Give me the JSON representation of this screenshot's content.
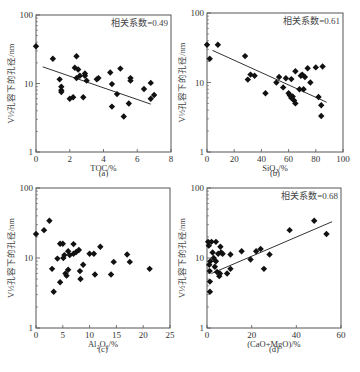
{
  "figure": {
    "ylabel": "V½孔容下的孔径/nm",
    "panels": [
      {
        "id": "a",
        "label": "(a)",
        "xlabel": "TOC/%",
        "corr": "相关系数=0.49"
      },
      {
        "id": "b",
        "label": "(b)",
        "xlabel": "SiO₂/%",
        "corr": "相关系数=0.61"
      },
      {
        "id": "c",
        "label": "(c)",
        "xlabel": "Al₂O₃/%",
        "corr": ""
      },
      {
        "id": "d",
        "label": "(d)",
        "xlabel": "(CaO+MgO)/%",
        "corr": "相关系数=0.68"
      }
    ]
  },
  "chart_data": [
    {
      "type": "scatter",
      "title": "(a)",
      "xlabel": "TOC/%",
      "ylabel": "V½孔容下的孔径/nm",
      "xlim": [
        0,
        8
      ],
      "ylim": [
        1,
        100
      ],
      "yscale": "log",
      "xticks": [
        0,
        2,
        4,
        6,
        8
      ],
      "yticks": [
        1,
        10,
        100
      ],
      "annotation": "相关系数=0.49",
      "points": [
        [
          0,
          35
        ],
        [
          1,
          23
        ],
        [
          1.4,
          11.5
        ],
        [
          1.5,
          9
        ],
        [
          1.5,
          8
        ],
        [
          1.5,
          7.5
        ],
        [
          2,
          6
        ],
        [
          2.2,
          6.3
        ],
        [
          2.3,
          17
        ],
        [
          2.4,
          25
        ],
        [
          2.4,
          12
        ],
        [
          2.5,
          16
        ],
        [
          2.6,
          13
        ],
        [
          2.8,
          6.3
        ],
        [
          2.9,
          14
        ],
        [
          2.9,
          13
        ],
        [
          3,
          11
        ],
        [
          3.6,
          11.5
        ],
        [
          3.7,
          12
        ],
        [
          4.4,
          14.5
        ],
        [
          4.5,
          9.8
        ],
        [
          4.5,
          4.6
        ],
        [
          4.8,
          7
        ],
        [
          5,
          16.5
        ],
        [
          5.2,
          3.3
        ],
        [
          5.5,
          5.1
        ],
        [
          5.6,
          11
        ],
        [
          5.6,
          12
        ],
        [
          6.4,
          8.3
        ],
        [
          6.8,
          10.2
        ],
        [
          6.8,
          6
        ],
        [
          7,
          6.8
        ]
      ],
      "trendline": {
        "x": [
          0.4,
          6.8
        ],
        "y": [
          17.5,
          5
        ]
      }
    },
    {
      "type": "scatter",
      "title": "(b)",
      "xlabel": "SiO₂/%",
      "ylabel": "V½孔容下的孔径/nm",
      "xlim": [
        0,
        100
      ],
      "ylim": [
        1,
        100
      ],
      "yscale": "log",
      "xticks": [
        0,
        20,
        40,
        60,
        80,
        100
      ],
      "yticks": [
        1,
        10,
        100
      ],
      "annotation": "相关系数=0.61",
      "points": [
        [
          0,
          35
        ],
        [
          2,
          22
        ],
        [
          8,
          35
        ],
        [
          28,
          24
        ],
        [
          30,
          11
        ],
        [
          32,
          13
        ],
        [
          35,
          12.5
        ],
        [
          43,
          7
        ],
        [
          51,
          10
        ],
        [
          53,
          12
        ],
        [
          56,
          8.5
        ],
        [
          58,
          11.5
        ],
        [
          60,
          7
        ],
        [
          61,
          6.5
        ],
        [
          62,
          6
        ],
        [
          63,
          6.3
        ],
        [
          64,
          5.5
        ],
        [
          65,
          5
        ],
        [
          62,
          11.2
        ],
        [
          65,
          14.5
        ],
        [
          68,
          8
        ],
        [
          69,
          12.5
        ],
        [
          70,
          13
        ],
        [
          71,
          8
        ],
        [
          72,
          12
        ],
        [
          74,
          16
        ],
        [
          76,
          10
        ],
        [
          80,
          16.5
        ],
        [
          82,
          6.2
        ],
        [
          84,
          4.7
        ],
        [
          84,
          3.3
        ],
        [
          85,
          17
        ]
      ],
      "trendline": {
        "x": [
          4,
          88
        ],
        "y": [
          29,
          5.2
        ]
      }
    },
    {
      "type": "scatter",
      "title": "(c)",
      "xlabel": "Al₂O₃/%",
      "ylabel": "V½孔容下的孔径/nm",
      "xlim": [
        0,
        25
      ],
      "ylim": [
        1,
        100
      ],
      "yscale": "log",
      "xticks": [
        0,
        5,
        10,
        15,
        20,
        25
      ],
      "yticks": [
        1,
        10,
        100
      ],
      "annotation": "",
      "points": [
        [
          0,
          22
        ],
        [
          1.5,
          25
        ],
        [
          2.5,
          34
        ],
        [
          3,
          7
        ],
        [
          3.3,
          3.3
        ],
        [
          4,
          9.8
        ],
        [
          4.5,
          4.5
        ],
        [
          4.5,
          16
        ],
        [
          5,
          16
        ],
        [
          5.1,
          10
        ],
        [
          5.3,
          11
        ],
        [
          5.5,
          6
        ],
        [
          5.7,
          5.6
        ],
        [
          6,
          6.8
        ],
        [
          6,
          12.5
        ],
        [
          6.3,
          11
        ],
        [
          7,
          11.5
        ],
        [
          7,
          15.8
        ],
        [
          7.5,
          12.2
        ],
        [
          8,
          13
        ],
        [
          8.2,
          6.5
        ],
        [
          8.3,
          5
        ],
        [
          8.8,
          8
        ],
        [
          10,
          11.5
        ],
        [
          10.8,
          11.5
        ],
        [
          11,
          5.8
        ],
        [
          12,
          14.5
        ],
        [
          14,
          5.8
        ],
        [
          14.5,
          8.8
        ],
        [
          17,
          11.2
        ],
        [
          17.5,
          8.8
        ],
        [
          21.2,
          7
        ]
      ]
    },
    {
      "type": "scatter",
      "title": "(d)",
      "xlabel": "(CaO+MgO)/%",
      "ylabel": "V½孔容下的孔径/nm",
      "xlim": [
        0,
        60
      ],
      "ylim": [
        1,
        100
      ],
      "yscale": "log",
      "xticks": [
        0,
        20,
        40,
        60
      ],
      "yticks": [
        1,
        10,
        100
      ],
      "annotation": "相关系数=0.68",
      "points": [
        [
          0.5,
          17
        ],
        [
          0.8,
          15
        ],
        [
          1,
          8
        ],
        [
          1.2,
          6.5
        ],
        [
          1.3,
          4.6
        ],
        [
          1.3,
          3.3
        ],
        [
          1.5,
          9
        ],
        [
          2,
          17
        ],
        [
          2.5,
          12
        ],
        [
          3,
          10
        ],
        [
          3.5,
          7.5
        ],
        [
          4,
          17
        ],
        [
          4,
          9
        ],
        [
          4.5,
          6.3
        ],
        [
          5,
          11.5
        ],
        [
          5.5,
          5.5
        ],
        [
          5.8,
          6
        ],
        [
          6,
          14.5
        ],
        [
          6.3,
          12
        ],
        [
          7,
          11.5
        ],
        [
          9,
          6
        ],
        [
          10.5,
          7
        ],
        [
          10.5,
          11.2
        ],
        [
          15.5,
          12.5
        ],
        [
          19.5,
          9.5
        ],
        [
          22,
          12.5
        ],
        [
          24,
          13.5
        ],
        [
          25.5,
          7
        ],
        [
          28,
          11.2
        ],
        [
          37,
          25
        ],
        [
          48,
          34
        ],
        [
          53.5,
          22
        ]
      ],
      "trendline": {
        "x": [
          2,
          56
        ],
        "y": [
          6,
          33
        ]
      }
    }
  ]
}
